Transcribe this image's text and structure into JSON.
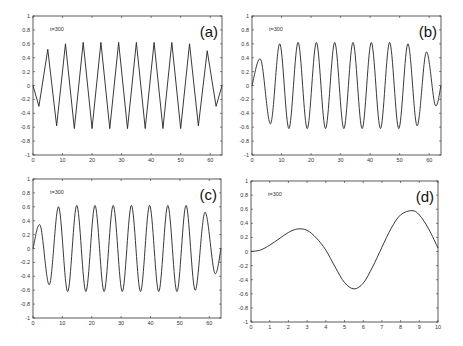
{
  "chart_data": [
    {
      "type": "line",
      "panel": "(a)",
      "annotation": "t=300",
      "xlim": [
        0,
        64
      ],
      "ylim": [
        -1,
        1
      ],
      "xticks": [
        0,
        10,
        20,
        30,
        40,
        50,
        60
      ],
      "yticks": [
        -1,
        -0.8,
        -0.6,
        -0.4,
        -0.2,
        0,
        0.2,
        0.4,
        0.6,
        0.8,
        1
      ],
      "style": "piecewise",
      "x": [
        0,
        2,
        5,
        8,
        11,
        14,
        17,
        20,
        23,
        26,
        29,
        32,
        35,
        38,
        41,
        44,
        47,
        50,
        53,
        56,
        59,
        62,
        64
      ],
      "y": [
        0,
        -0.3,
        0.52,
        -0.58,
        0.6,
        -0.62,
        0.62,
        -0.62,
        0.62,
        -0.62,
        0.62,
        -0.62,
        0.62,
        -0.62,
        0.62,
        -0.62,
        0.62,
        -0.62,
        0.6,
        -0.58,
        0.5,
        -0.3,
        0
      ]
    },
    {
      "type": "line",
      "panel": "(b)",
      "annotation": "t=300",
      "xlim": [
        0,
        64
      ],
      "ylim": [
        -1,
        1
      ],
      "xticks": [
        0,
        10,
        20,
        30,
        40,
        50,
        60
      ],
      "yticks": [
        -1,
        -0.8,
        -0.6,
        -0.4,
        -0.2,
        0,
        0.2,
        0.4,
        0.6,
        0.8,
        1
      ],
      "style": "smooth",
      "x": [
        0,
        3,
        6.3,
        9.4,
        12.5,
        15.6,
        18.7,
        21.8,
        24.9,
        28,
        31.1,
        34.2,
        37.3,
        40.4,
        43.5,
        46.6,
        49.7,
        52.8,
        55.9,
        59,
        62,
        64
      ],
      "y": [
        0,
        0.37,
        -0.55,
        0.6,
        -0.62,
        0.62,
        -0.62,
        0.62,
        -0.62,
        0.62,
        -0.62,
        0.62,
        -0.62,
        0.62,
        -0.62,
        0.62,
        -0.62,
        0.6,
        -0.58,
        0.48,
        -0.28,
        0
      ]
    },
    {
      "type": "line",
      "panel": "(c)",
      "annotation": "t=300",
      "xlim": [
        0,
        64
      ],
      "ylim": [
        -1,
        1
      ],
      "xticks": [
        0,
        10,
        20,
        30,
        40,
        50,
        60
      ],
      "yticks": [
        -1,
        -0.8,
        -0.6,
        -0.4,
        -0.2,
        0,
        0.2,
        0.4,
        0.6,
        0.8,
        1
      ],
      "style": "smooth",
      "x": [
        0,
        2.5,
        5.6,
        8.7,
        11.8,
        14.9,
        18,
        21.1,
        24.2,
        27.3,
        30.4,
        33.5,
        36.6,
        39.7,
        42.8,
        45.9,
        49,
        52.1,
        55.2,
        58.5,
        61.8,
        64
      ],
      "y": [
        0,
        0.33,
        -0.52,
        0.6,
        -0.62,
        0.62,
        -0.62,
        0.62,
        -0.62,
        0.62,
        -0.62,
        0.62,
        -0.62,
        0.62,
        -0.62,
        0.62,
        -0.62,
        0.62,
        -0.6,
        0.52,
        -0.35,
        0
      ]
    },
    {
      "type": "line",
      "panel": "(d)",
      "annotation": "t=300",
      "xlim": [
        0,
        10
      ],
      "ylim": [
        -1,
        1
      ],
      "xticks": [
        0,
        1,
        2,
        3,
        4,
        5,
        6,
        7,
        8,
        9,
        10
      ],
      "yticks": [
        -1,
        -0.8,
        -0.6,
        -0.4,
        -0.2,
        0,
        0.2,
        0.4,
        0.6,
        0.8,
        1
      ],
      "style": "smooth",
      "x": [
        0,
        0.5,
        1,
        1.5,
        2,
        2.5,
        3,
        3.5,
        4,
        4.5,
        5,
        5.5,
        6,
        6.5,
        7,
        7.5,
        8,
        8.6,
        9,
        9.5,
        10
      ],
      "y": [
        0,
        0.02,
        0.09,
        0.18,
        0.27,
        0.32,
        0.3,
        0.19,
        0.02,
        -0.22,
        -0.44,
        -0.53,
        -0.45,
        -0.22,
        0.06,
        0.33,
        0.52,
        0.58,
        0.52,
        0.32,
        0.05
      ]
    }
  ],
  "panels": {
    "a": {
      "label": "(a)",
      "annotation": "t=300"
    },
    "b": {
      "label": "(b)",
      "annotation": "t=300"
    },
    "c": {
      "label": "(c)",
      "annotation": "t=300"
    },
    "d": {
      "label": "(d)",
      "annotation": "t=300"
    }
  }
}
